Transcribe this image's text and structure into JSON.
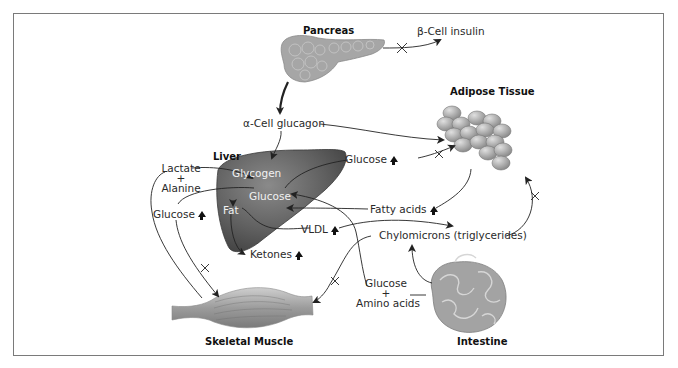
{
  "diagram": {
    "organs": {
      "pancreas": "Pancreas",
      "adipose": "Adipose Tissue",
      "liver": "Liver",
      "muscle": "Skeletal Muscle",
      "intestine": "Intestine"
    },
    "hormones": {
      "insulin": "β-Cell insulin",
      "glucagon": "α-Cell glucagon"
    },
    "liver_internal": {
      "glycogen": "Glycogen",
      "glucose": "Glucose",
      "fat": "Fat"
    },
    "metabolites": {
      "lactate": "Lactate",
      "plus1": "+",
      "alanine": "Alanine",
      "glucose_left": "Glucose",
      "glucose_top": "Glucose",
      "fatty_acids": "Fatty acids",
      "vldl": "VLDL",
      "chylomicrons": "Chylomicrons (triglycerides)",
      "ketones": "Ketones",
      "glucose_bottom": "Glucose",
      "plus2": "+",
      "amino_acids": "Amino acids"
    },
    "markers": {
      "increase": "up-arrow",
      "blocked": "cross-mark"
    },
    "colors": {
      "frame": "#7a7a7a",
      "organ_gray": "#9a9a9a",
      "liver_dark": "#5e5e5e",
      "arrow": "#222222"
    }
  }
}
